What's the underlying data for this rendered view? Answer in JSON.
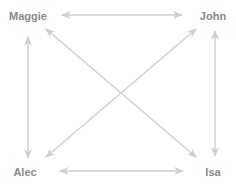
{
  "diagram": {
    "type": "complete-graph",
    "colors": {
      "edge": "#cfcfcf",
      "label": "#8a8a8a",
      "background": "#ffffff"
    },
    "nodes": [
      {
        "id": "maggie",
        "label": "Maggie",
        "x": 28,
        "y": 16
      },
      {
        "id": "john",
        "label": "John",
        "x": 213,
        "y": 16
      },
      {
        "id": "alec",
        "label": "Alec",
        "x": 25,
        "y": 172
      },
      {
        "id": "isa",
        "label": "Isa",
        "x": 213,
        "y": 172
      }
    ],
    "edges": [
      {
        "from": "maggie",
        "to": "john",
        "direction": "both"
      },
      {
        "from": "alec",
        "to": "isa",
        "direction": "both"
      },
      {
        "from": "maggie",
        "to": "alec",
        "direction": "both"
      },
      {
        "from": "john",
        "to": "isa",
        "direction": "both"
      },
      {
        "from": "maggie",
        "to": "isa",
        "direction": "both"
      },
      {
        "from": "john",
        "to": "alec",
        "direction": "both"
      }
    ]
  }
}
